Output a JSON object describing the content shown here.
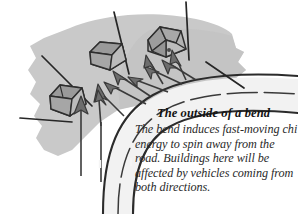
{
  "figure": {
    "alt_name": "feng-shui-road-bend-diagram",
    "caption": {
      "title": "The outside of a bend",
      "body": "The bend induces fast-moving chi energy to spin away from the road. Buildings here will be affected by vehicles coming from both directions."
    },
    "palette": {
      "page_background": "#ffffff",
      "land_blob": "#c9c9c9",
      "land_blob_shadow": "#bdbdbd",
      "road_surface": "#f4f4f4",
      "road_outline": "#2b2b2b",
      "building_roof": "#a0a0a0",
      "building_wall_light": "#b4b4b4",
      "building_wall_dark": "#8f8f8f",
      "building_outline": "#2e2e2e",
      "arrow_fill": "#6d6d6d",
      "arrow_outline": "#3a3a3a",
      "plot_line": "#262626",
      "text_title": "#131313",
      "text_body": "#2a2a2a"
    },
    "elements": {
      "land_label": "land-area",
      "road_label": "curved-road",
      "buildings": [
        {
          "name": "building-left",
          "position": "lower-left"
        },
        {
          "name": "building-middle",
          "position": "upper-middle"
        },
        {
          "name": "building-right",
          "position": "upper-right"
        }
      ],
      "plot_dividers": [
        "plot-divider-left",
        "plot-divider-middle",
        "plot-divider-right",
        "plot-divider-far-right"
      ],
      "chi_arrows": [
        {
          "name": "chi-arrow-1",
          "direction": "up"
        },
        {
          "name": "chi-arrow-2",
          "direction": "up"
        },
        {
          "name": "chi-arrow-3",
          "direction": "up-left"
        },
        {
          "name": "chi-arrow-4",
          "direction": "up-left"
        },
        {
          "name": "chi-arrow-5",
          "direction": "up-left"
        },
        {
          "name": "chi-arrow-6",
          "direction": "up-left"
        },
        {
          "name": "chi-arrow-7",
          "direction": "up-left"
        },
        {
          "name": "chi-arrow-8",
          "direction": "up-left"
        }
      ]
    }
  }
}
